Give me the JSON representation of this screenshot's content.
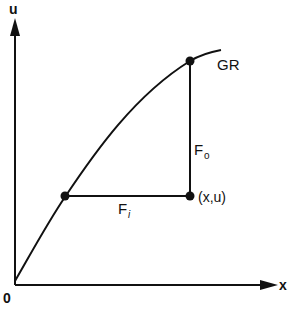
{
  "diagram": {
    "axes": {
      "x_label": "x",
      "y_label": "u",
      "origin_label": "0"
    },
    "curve": {
      "label": "GR"
    },
    "points": {
      "lower_curve_point": "",
      "upper_curve_point": "",
      "state_point": "(x,u)"
    },
    "segments": {
      "horizontal": {
        "label_main": "F",
        "label_sub": "i"
      },
      "vertical": {
        "label_main": "F",
        "label_sub": "o"
      }
    },
    "colors": {
      "ink": "#111111",
      "background": "#ffffff"
    }
  }
}
